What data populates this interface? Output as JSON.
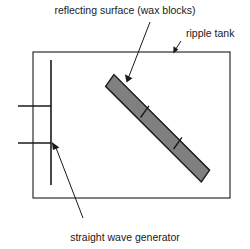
{
  "figure": {
    "background_color": "#ffffff",
    "line_color": "#1a1a1a",
    "block_fill_color": "#808080",
    "block_stroke_color": "#1a1a1a",
    "text_color": "#1a1a1a"
  },
  "labels": {
    "reflecting_surface": "reflecting surface (wax blocks)",
    "ripple_tank": "ripple tank",
    "wave_generator": "straight wave generator"
  },
  "components": {
    "tank": {
      "name": "ripple tank",
      "x": 33,
      "y": 52,
      "width": 197,
      "height": 146
    },
    "generator_bar": {
      "name": "straight wave generator",
      "x": 51,
      "y_top": 60,
      "y_bottom": 185
    },
    "wavefronts": [
      {
        "y": 106,
        "x_start": 18,
        "x_end": 51
      },
      {
        "y": 143,
        "x_start": 18,
        "x_end": 51
      }
    ],
    "wax_blocks": {
      "name": "reflecting surface (wax blocks)",
      "segments": 3,
      "start": {
        "x": 107,
        "y": 80
      },
      "end": {
        "x": 208,
        "y": 176
      },
      "thickness": 15
    }
  },
  "leader_lines": {
    "reflecting_surface": {
      "from_x": 150,
      "from_y": 22,
      "to_x": 126,
      "to_y": 81
    },
    "ripple_tank": {
      "from_x": 180,
      "from_y": 38,
      "to_x": 174,
      "to_y": 53
    },
    "wave_generator": {
      "from_x": 82,
      "from_y": 216,
      "to_x": 53,
      "to_y": 144
    }
  }
}
